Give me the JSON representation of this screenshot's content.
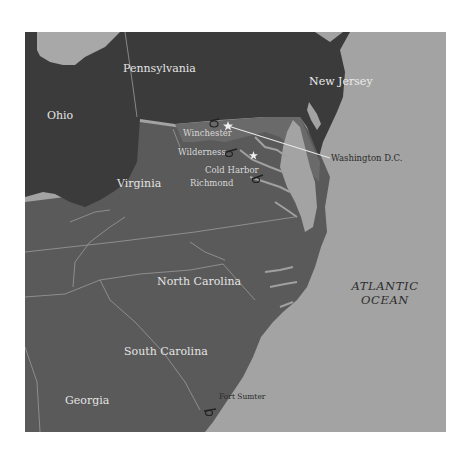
{
  "map": {
    "colors": {
      "ocean": "#a3a3a3",
      "great_lake": "#a8a8a8",
      "northern_states": "#3b3b3b",
      "southern_states": "#5a5a5a",
      "maryland_delaware": "#6a6a6a",
      "border_lines": "#9a9a9a",
      "coast_rivers": "#a0a0a0",
      "connector_line": "#e8e8e8"
    },
    "states": {
      "ohio": "Ohio",
      "pennsylvania": "Pennsylvania",
      "new_jersey": "New Jersey",
      "virginia": "Virginia",
      "north_carolina": "North Carolina",
      "south_carolina": "South Carolina",
      "georgia": "Georgia"
    },
    "ocean_label": {
      "line1": "ATLANTIC",
      "line2": "OCEAN"
    },
    "sites": {
      "winchester": "Winchester",
      "wilderness": "Wilderness",
      "cold_harbor": "Cold Harbor",
      "richmond": "Richmond",
      "washington": "Washington D.C.",
      "fort_sumter": "Fort Sumter"
    },
    "markers": {
      "battle_icon": "cannon-icon",
      "capital_icon": "star-icon"
    }
  }
}
